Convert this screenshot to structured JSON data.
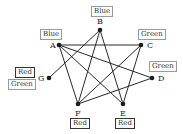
{
  "graph": {
    "nodes": [
      {
        "id": "A",
        "label": "A",
        "x": 59,
        "y": 45,
        "lx": 50,
        "ly": 48
      },
      {
        "id": "B",
        "label": "B",
        "x": 100,
        "y": 30,
        "lx": 97,
        "ly": 24
      },
      {
        "id": "C",
        "label": "C",
        "x": 141,
        "y": 45,
        "lx": 147,
        "ly": 48
      },
      {
        "id": "D",
        "label": "D",
        "x": 152,
        "y": 78,
        "lx": 158,
        "ly": 81
      },
      {
        "id": "E",
        "label": "E",
        "x": 123,
        "y": 104,
        "lx": 120,
        "ly": 116
      },
      {
        "id": "F",
        "label": "F",
        "x": 78,
        "y": 104,
        "lx": 75,
        "ly": 116
      },
      {
        "id": "G",
        "label": "G",
        "x": 49,
        "y": 78,
        "lx": 38,
        "ly": 81
      }
    ],
    "edges": [
      [
        "A",
        "C"
      ],
      [
        "A",
        "D"
      ],
      [
        "A",
        "E"
      ],
      [
        "A",
        "F"
      ],
      [
        "B",
        "G"
      ],
      [
        "B",
        "F"
      ],
      [
        "B",
        "E"
      ],
      [
        "C",
        "F"
      ],
      [
        "C",
        "E"
      ],
      [
        "D",
        "F"
      ]
    ],
    "tags": [
      {
        "node": "B",
        "text": "Blue",
        "style": "light",
        "left": 91,
        "top": 6
      },
      {
        "node": "A",
        "text": "Blue",
        "style": "light",
        "left": 40,
        "top": 29
      },
      {
        "node": "C",
        "text": "Green",
        "style": "light",
        "left": 138,
        "top": 29
      },
      {
        "node": "D",
        "text": "Green",
        "style": "light",
        "left": 149,
        "top": 61
      },
      {
        "node": "G",
        "text": "Red",
        "style": "dark",
        "left": 15,
        "top": 67
      },
      {
        "node": "G",
        "text": "Green",
        "style": "light",
        "left": 8,
        "top": 79
      },
      {
        "node": "F",
        "text": "Red",
        "style": "dark",
        "left": 70,
        "top": 118
      },
      {
        "node": "E",
        "text": "Red",
        "style": "dark",
        "left": 115,
        "top": 118
      }
    ]
  },
  "colors": {
    "edge": "#2a2a2a",
    "node": "#1a1a1a"
  }
}
